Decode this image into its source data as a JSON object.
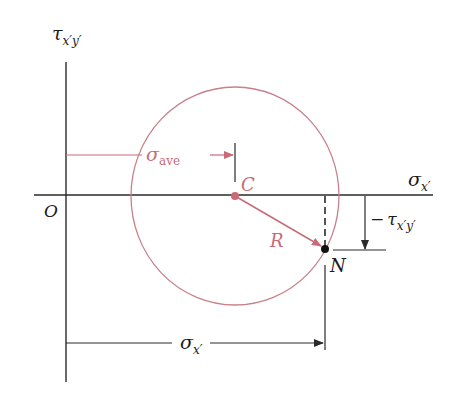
{
  "diagram": {
    "colors": {
      "axis": "#2a2a2a",
      "circle": "#c8808a",
      "accent": "#c86b78",
      "point_N": "#111111",
      "background": "#ffffff"
    },
    "axes": {
      "vertical": {
        "symbol": "τ",
        "subscript": "x′y′"
      },
      "horizontal": {
        "symbol": "σ",
        "subscript": "x′"
      },
      "origin": "O"
    },
    "labels": {
      "center": "C",
      "radius": "R",
      "point": "N",
      "sigma_ave": {
        "symbol": "σ",
        "subscript": "ave"
      },
      "neg_tau": {
        "prefix": "−",
        "symbol": "τ",
        "subscript": "x′y′"
      },
      "sigma_x_dim": {
        "symbol": "σ",
        "subscript": "x′"
      }
    }
  }
}
